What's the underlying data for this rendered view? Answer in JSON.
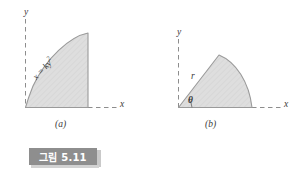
{
  "figure": {
    "caption": {
      "text": "그림 5.11",
      "box_color": "#8e8e8e",
      "text_color": "#ffffff"
    },
    "style": {
      "region_fill": "#dedede",
      "region_stroke": "#9a9a9a",
      "axis_color": "#8a8a8a",
      "label_color": "#3b3b3b",
      "background": "#ffffff",
      "hatch_color": "#cfcfcf"
    },
    "panels": [
      {
        "id": "a",
        "sublabel": "(a)",
        "axis_x_label": "x",
        "axis_y_label": "y",
        "curve_label_lhs": "x",
        "curve_label_eq": "=",
        "curve_label_rhs": "ky",
        "curve_label_exp": "2",
        "curve_label_full": "x = ky²",
        "description": "parabolic region bounded by x = ky squared, the y-axis region filled with light gray hatching"
      },
      {
        "id": "b",
        "sublabel": "(b)",
        "axis_x_label": "x",
        "axis_y_label": "y",
        "radius_label": "r",
        "angle_label": "θ",
        "description": "circular sector of radius r subtending angle theta from the x-axis, filled with light gray hatching"
      }
    ]
  }
}
